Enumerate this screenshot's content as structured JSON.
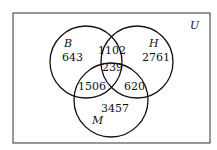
{
  "universe_label": "U",
  "sets": {
    "B": {
      "label": "B",
      "only": "643"
    },
    "H": {
      "label": "H",
      "only": "2761"
    },
    "M": {
      "label": "M",
      "only": "3457"
    }
  },
  "intersections": {
    "B_H": "1102",
    "B_H_M": "239",
    "B_M": "1506",
    "H_M": "620"
  },
  "colors": {
    "stroke": "#111111",
    "background": "#ffffff"
  }
}
